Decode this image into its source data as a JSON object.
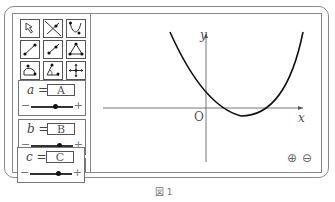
{
  "toolbar": {
    "tools": [
      {
        "name": "move-arrow-icon"
      },
      {
        "name": "line-through-points-icon"
      },
      {
        "name": "function-curve-icon"
      },
      {
        "name": "segment-icon"
      },
      {
        "name": "ray-icon"
      },
      {
        "name": "triangle-polygon-icon"
      },
      {
        "name": "arc-icon"
      },
      {
        "name": "angle-icon"
      },
      {
        "name": "move-view-icon"
      }
    ]
  },
  "parameters": [
    {
      "variable": "a",
      "equals": "=",
      "value": "A",
      "minus": "−",
      "plus": "+"
    },
    {
      "variable": "b",
      "equals": "=",
      "value": "B",
      "minus": "−",
      "plus": "+"
    },
    {
      "variable": "c",
      "equals": "=",
      "value": "C",
      "minus": "−",
      "plus": "+"
    }
  ],
  "graph": {
    "x_label": "x",
    "y_label": "y",
    "origin_label": "O",
    "zoom_in": "⊕",
    "zoom_out": "⊖"
  },
  "caption": "図 1"
}
